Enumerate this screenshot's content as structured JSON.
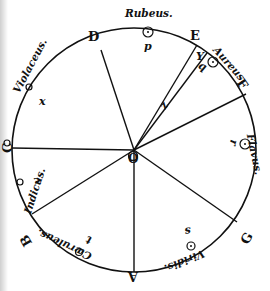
{
  "diagram": {
    "center": {
      "label": "O",
      "x": 134,
      "y": 150
    },
    "radius": 122,
    "colors": {
      "ink": "#111111",
      "paper": "#ffffff"
    },
    "points": {
      "A": "A",
      "B": "B",
      "C": "C",
      "D": "D",
      "E": "E",
      "F": "F",
      "G": "G",
      "Y": "Y",
      "Z": "Z"
    },
    "color_names": {
      "rubeus": "Rubeus.",
      "aureus": "Aureus.",
      "flavus": "Flavus.",
      "viridis": "Viridis.",
      "caeruleus": "Cæruleus.",
      "indicus": "Indicus.",
      "violaceus": "Violaceus."
    },
    "centroid_labels": {
      "p": "p",
      "q": "q",
      "r": "r",
      "s": "s",
      "t": "t",
      "v": "v",
      "x": "x",
      "z": "z",
      "o": "O"
    }
  }
}
